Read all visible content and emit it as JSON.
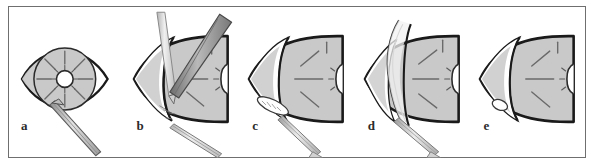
{
  "figure": {
    "kind": "surgical-procedure-sequence",
    "panel_count": 5,
    "frame_color": "#6f6f6f",
    "background_color": "#ffffff",
    "ink_color": "#1a1a1a",
    "tissue_fill_color": "#c9c9c9",
    "tissue_fill_light": "#dedede",
    "instrument_light_color": "#d8d8d8",
    "instrument_dark_color": "#8a8a8a",
    "pupil_color": "#ffffff"
  },
  "panels": [
    {
      "label": "a",
      "view": "frontal-eye",
      "description": "Frontal view of open eye with almond-shaped lid opening, round radially-marked cornea and central pupil, forceps entering from lower left",
      "elements": {
        "eye_outline": "eyelid-aperture-outline",
        "cornea": "cornea-disc",
        "radial_marks": 8,
        "pupil": "pupil-opening",
        "instrument_1": "forceps-instrument"
      }
    },
    {
      "label": "b",
      "view": "oblique-globe",
      "description": "Oblique view of globe with conjunctival wedge, vertical light instrument and dark angled blade creating the flap",
      "elements": {
        "globe_outline": "globe-outline",
        "flap_edge": "corneal-flap-edge",
        "radial_marks": 4,
        "pupil": "pupil-opening",
        "instrument_1": "light-probe-instrument",
        "instrument_2": "dark-blade-instrument",
        "instrument_3": "forceps-instrument"
      }
    },
    {
      "label": "c",
      "view": "oblique-globe",
      "description": "Oblique view with hatched oval pocket incision at lower left and forceps at lower edge",
      "elements": {
        "globe_outline": "globe-outline",
        "flap_edge": "corneal-flap-edge",
        "radial_marks": 4,
        "pupil": "pupil-opening",
        "pocket": "hatched-pocket-incision",
        "instrument_1": "forceps-instrument"
      }
    },
    {
      "label": "d",
      "view": "oblique-globe",
      "description": "Oblique view with the flap lifted and folded back showing curved peeled edge, forceps at lower edge",
      "elements": {
        "globe_outline": "globe-outline",
        "lifted_flap": "lifted-corneal-flap",
        "radial_marks": 4,
        "pupil": "pupil-opening",
        "instrument_1": "forceps-instrument"
      }
    },
    {
      "label": "e",
      "view": "oblique-globe",
      "description": "Final oblique view with flap repositioned and small oval implant marking visible, no instruments",
      "elements": {
        "globe_outline": "globe-outline",
        "flap_edge": "corneal-flap-edge",
        "radial_marks": 4,
        "pupil": "pupil-opening",
        "implant_mark": "oval-implant-marking"
      }
    }
  ]
}
